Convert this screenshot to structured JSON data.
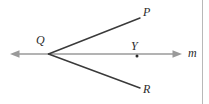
{
  "figure": {
    "kind": "geometry-diagram",
    "canvas": {
      "width": 209,
      "height": 104,
      "background": "#ffffff"
    },
    "colors": {
      "ray_stroke": "#3a3a3a",
      "line_stroke": "#9a9a9a",
      "label_text": "#2b2b2b",
      "point_dot": "#2b2b2b",
      "border_rule": "#b8b8b8"
    },
    "labels": {
      "q": "Q",
      "p": "P",
      "r": "R",
      "y": "Y",
      "m": "m"
    },
    "points": {
      "q": {
        "x": 49,
        "y": 54
      },
      "p": {
        "x": 140,
        "y": 18
      },
      "r": {
        "x": 140,
        "y": 88
      },
      "y": {
        "x": 137,
        "y": 56
      },
      "line_left_end": {
        "x": 12,
        "y": 54
      },
      "line_right_end": {
        "x": 181,
        "y": 54
      }
    },
    "segments": [
      {
        "name": "ray-QP",
        "from": "q",
        "to": "p",
        "arrow": false,
        "stroke": "#3a3a3a",
        "width": 1.4
      },
      {
        "name": "ray-QR",
        "from": "q",
        "to": "r",
        "arrow": false,
        "stroke": "#3a3a3a",
        "width": 1.4
      },
      {
        "name": "line-m",
        "from": "line_left_end",
        "to": "line_right_end",
        "arrow": true,
        "stroke": "#9a9a9a",
        "width": 1.6
      }
    ],
    "border": {
      "right_rule_x": 203,
      "visible": true
    }
  }
}
